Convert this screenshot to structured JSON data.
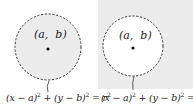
{
  "panels": [
    {
      "id": "left",
      "description": "interior shaded (region inside circle)",
      "background": "#ffffff",
      "circle_fill": "#ececec",
      "center_label": "(a,  b)",
      "equation": {
        "lhs1": "(x − a)",
        "exp1": "2",
        "plus": " + ",
        "lhs2": "(y − b)",
        "exp2": "2",
        "eq": " = ",
        "rhs": "r",
        "exp3": "2"
      }
    },
    {
      "id": "right",
      "description": "exterior shaded (region outside circle)",
      "background": "#ececec",
      "circle_fill": "#ffffff",
      "center_label": "(a,  b)",
      "equation": {
        "lhs1": "(x − a)",
        "exp1": "2",
        "plus": " + ",
        "lhs2": "(y − b)",
        "exp2": "2",
        "eq": " = ",
        "rhs": "r",
        "exp3": "2"
      }
    }
  ],
  "colors": {
    "stroke": "#333333",
    "shade": "#ececec",
    "text": "#222222"
  }
}
